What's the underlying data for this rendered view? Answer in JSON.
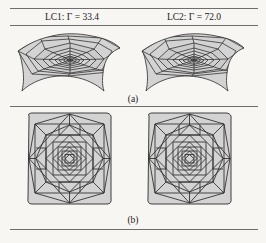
{
  "figure": {
    "columns": [
      {
        "id": "lc1",
        "text": "LC1: Γ = 33.4",
        "load_case": "LC1",
        "symbol": "Γ",
        "value": "33.4"
      },
      {
        "id": "lc2",
        "text": "LC2: Γ = 72.0",
        "load_case": "LC2",
        "symbol": "Γ",
        "value": "72.0"
      }
    ],
    "panels": [
      {
        "id": "a",
        "caption": "(a)",
        "view": "perspective",
        "description": "saddle-shaped doubly-curved gridshell with concentric polygonal rings and radial members"
      },
      {
        "id": "b",
        "caption": "(b)",
        "view": "plan",
        "description": "square plan view of nested rotated squares forming an octagonal star grid"
      }
    ],
    "colors": {
      "background": "#f7f6f3",
      "rule": "#6e6e6e",
      "mesh_line": "#2b2b2b",
      "surface_fill": "#d3d3d3",
      "surface_fill_dark": "#bdbdbd",
      "text": "#1a1a1a"
    }
  }
}
